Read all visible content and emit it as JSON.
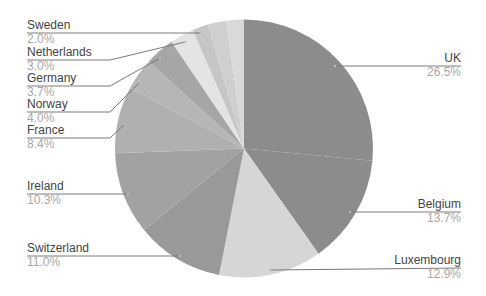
{
  "chart_data": {
    "type": "pie",
    "title": "",
    "start_angle_deg": 0,
    "direction": "clockwise",
    "categories": [
      "UK",
      "Belgium",
      "Luxembourg",
      "Switzerland",
      "Ireland",
      "France",
      "Norway",
      "Germany",
      "Netherlands",
      "Sweden",
      "",
      ""
    ],
    "values": [
      26.5,
      13.7,
      12.9,
      11.0,
      10.3,
      8.4,
      4.0,
      3.7,
      3.0,
      2.0,
      2.3,
      2.2
    ],
    "value_labels": [
      "26.5%",
      "13.7%",
      "12.9%",
      "11.0%",
      "10.3%",
      "8.4%",
      "4.0%",
      "3.7%",
      "3.0%",
      "2.0%",
      "",
      ""
    ],
    "colors": [
      "#8c8c8c",
      "#8c8c8c",
      "#d6d6d6",
      "#999999",
      "#a2a2a2",
      "#b0b0b0",
      "#b6b6b6",
      "#a6a6a6",
      "#e4e4e4",
      "#c6c6c6",
      "#cfcfcf",
      "#d9d9d9"
    ],
    "legend": "none",
    "labels_outside": true
  },
  "labels": [
    {
      "name": "UK",
      "pct": "26.5%",
      "side": "right",
      "x": 461,
      "y": 62,
      "line": [
        [
          335,
          66
        ],
        [
          461,
          66
        ]
      ]
    },
    {
      "name": "Belgium",
      "pct": "13.7%",
      "side": "right",
      "x": 461,
      "y": 208,
      "line": [
        [
          350,
          212
        ],
        [
          461,
          212
        ]
      ]
    },
    {
      "name": "Luxembourg",
      "pct": "12.9%",
      "side": "right",
      "x": 461,
      "y": 264,
      "line": [
        [
          270,
          270
        ],
        [
          461,
          268
        ]
      ]
    },
    {
      "name": "Switzerland",
      "pct": "11.0%",
      "side": "left",
      "x": 27,
      "y": 252,
      "line": [
        [
          27,
          256
        ],
        [
          180,
          256
        ]
      ]
    },
    {
      "name": "Ireland",
      "pct": "10.3%",
      "side": "left",
      "x": 27,
      "y": 190,
      "line": [
        [
          27,
          194
        ],
        [
          128,
          194
        ]
      ]
    },
    {
      "name": "France",
      "pct": "8.4%",
      "side": "left",
      "x": 27,
      "y": 134,
      "line": [
        [
          27,
          138
        ],
        [
          110,
          138
        ],
        [
          125,
          124
        ]
      ]
    },
    {
      "name": "Norway",
      "pct": "4.0%",
      "side": "left",
      "x": 27,
      "y": 108,
      "line": [
        [
          27,
          112
        ],
        [
          110,
          112
        ],
        [
          140,
          82
        ]
      ]
    },
    {
      "name": "Germany",
      "pct": "3.7%",
      "side": "left",
      "x": 27,
      "y": 82,
      "line": [
        [
          27,
          86
        ],
        [
          110,
          86
        ],
        [
          160,
          58
        ]
      ]
    },
    {
      "name": "Netherlands",
      "pct": "3.0%",
      "side": "left",
      "x": 27,
      "y": 56,
      "line": [
        [
          27,
          60
        ],
        [
          110,
          60
        ],
        [
          185,
          42
        ]
      ]
    },
    {
      "name": "Sweden",
      "pct": "2.0%",
      "side": "left",
      "x": 27,
      "y": 29,
      "line": [
        [
          27,
          33
        ],
        [
          201,
          33
        ]
      ]
    }
  ],
  "geometry": {
    "cx": 244,
    "cy": 148.5,
    "r": 129
  }
}
